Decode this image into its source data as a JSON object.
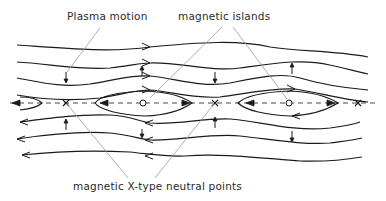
{
  "diagram": {
    "labels": {
      "plasma_motion": "Plasma motion",
      "magnetic_islands": "magnetic islands",
      "x_points": "magnetic X-type neutral points"
    },
    "elements": {
      "field_lines_above": 4,
      "field_lines_below": 3,
      "x_points_count": 3,
      "o_points_count": 2,
      "flow_direction_above": "right",
      "flow_direction_below": "left"
    },
    "colors": {
      "line": "#1a1a1a",
      "leader": "#9a9a9a",
      "text": "#2a2a2a",
      "background": "#ffffff"
    }
  }
}
